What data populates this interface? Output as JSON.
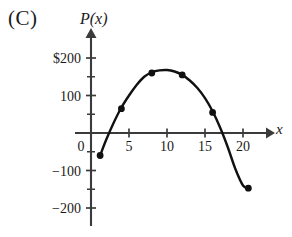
{
  "figure": {
    "panel_label": "(C)",
    "y_axis_label": "P(x)",
    "x_axis_label": "x"
  },
  "chart_data": {
    "type": "line",
    "title": "(C)",
    "xlabel": "x",
    "ylabel": "P(x)",
    "xlim": [
      -1.2,
      23
    ],
    "ylim": [
      -245,
      250
    ],
    "grid": false,
    "legend": null,
    "x_ticks": [
      0,
      5,
      10,
      15,
      20
    ],
    "x_tick_labels": [
      "0",
      "5",
      "10",
      "15",
      "20"
    ],
    "x_minor_tick_interval": 5,
    "y_ticks": [
      -200,
      -100,
      0,
      100,
      200
    ],
    "y_tick_labels": [
      "−200",
      "−100",
      "0",
      "100",
      "$200"
    ],
    "y_minor_ticks": [
      -150,
      -50,
      50,
      150
    ],
    "curve": {
      "name": "P(x)",
      "shape": "parabola",
      "vertex": [
        10,
        168
      ],
      "roots": [
        2.7,
        17.3
      ],
      "color": "#111111",
      "x": [
        1.2,
        2,
        3,
        4,
        5,
        6,
        7,
        8,
        9,
        10,
        11,
        12,
        13,
        14,
        15,
        16,
        17,
        18,
        19,
        20,
        20.7
      ],
      "y": [
        -60,
        -18,
        28,
        68,
        100,
        128,
        150,
        162,
        167,
        168,
        164,
        155,
        140,
        120,
        93,
        58,
        14,
        -38,
        -96,
        -140,
        -147
      ]
    },
    "markers": {
      "style": "filled-square-dot",
      "points": [
        {
          "x": 1.2,
          "y": -60
        },
        {
          "x": 4,
          "y": 65
        },
        {
          "x": 8,
          "y": 160
        },
        {
          "x": 12,
          "y": 155
        },
        {
          "x": 16,
          "y": 55
        },
        {
          "x": 20.7,
          "y": -147
        }
      ]
    },
    "axis_arrows": {
      "x": "right",
      "y": "up"
    }
  }
}
